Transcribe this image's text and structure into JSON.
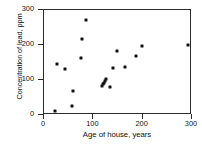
{
  "chart_data": {
    "type": "scatter",
    "title": "",
    "xlabel": "Age of house, years",
    "ylabel": "Concentration of lead, ppm",
    "xlim": [
      0,
      300
    ],
    "ylim": [
      0,
      300
    ],
    "xticks": [
      0,
      100,
      200,
      300
    ],
    "yticks": [
      0,
      100,
      200,
      300
    ],
    "grid": false,
    "legend": null,
    "marker": "filled-square",
    "marker_color": "#111111",
    "frame_color": "#2b2b2b",
    "background": "#ffffff",
    "n_points": 20,
    "series": [
      {
        "name": "lead vs house age",
        "points": [
          {
            "x": 22,
            "y": 11
          },
          {
            "x": 27,
            "y": 146
          },
          {
            "x": 43,
            "y": 132
          },
          {
            "x": 57,
            "y": 25
          },
          {
            "x": 58,
            "y": 68
          },
          {
            "x": 75,
            "y": 163
          },
          {
            "x": 78,
            "y": 218
          },
          {
            "x": 86,
            "y": 272
          },
          {
            "x": 117,
            "y": 84
          },
          {
            "x": 119,
            "y": 88
          },
          {
            "x": 121,
            "y": 92
          },
          {
            "x": 123,
            "y": 97
          },
          {
            "x": 125,
            "y": 102
          },
          {
            "x": 133,
            "y": 80
          },
          {
            "x": 140,
            "y": 133
          },
          {
            "x": 148,
            "y": 184
          },
          {
            "x": 164,
            "y": 136
          },
          {
            "x": 186,
            "y": 170
          },
          {
            "x": 198,
            "y": 198
          },
          {
            "x": 292,
            "y": 200
          }
        ]
      }
    ]
  }
}
